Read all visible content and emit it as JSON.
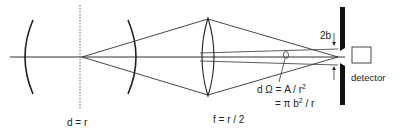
{
  "diagram": {
    "type": "optical-setup",
    "labels": {
      "mirror_distance": "d = r",
      "focal_length": "f = r / 2",
      "slit_width": "2b",
      "detector": "detector",
      "solid_angle_line1": "d Ω = A / r",
      "solid_angle_line1_sup": "2",
      "solid_angle_line2_prefix": "= π b",
      "solid_angle_line2_sup": "2",
      "solid_angle_line2_suffix": " / r"
    },
    "components": [
      "concave-mirror-left",
      "focal-plane",
      "concave-mirror-right",
      "converging-lens",
      "aperture-slit",
      "detector"
    ],
    "colors": {
      "line": "#222222",
      "background": "#ffffff"
    }
  }
}
